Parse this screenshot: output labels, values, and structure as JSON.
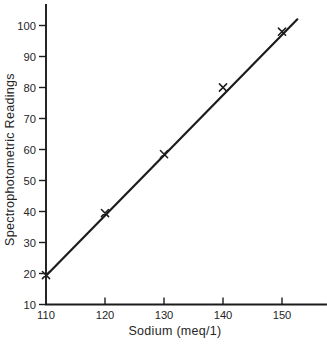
{
  "figure": {
    "background": "#ffffff",
    "ink": "#1c1c1c",
    "label_color": "#262626"
  },
  "chart_data": {
    "type": "scatter",
    "title": "",
    "xlabel": "Sodium (meq/1)",
    "ylabel": "Spectrophotometric Readings",
    "x_ticks": [
      110,
      120,
      130,
      140,
      150
    ],
    "y_ticks": [
      10,
      20,
      30,
      40,
      50,
      60,
      70,
      80,
      90,
      100
    ],
    "xlim": [
      110,
      157.5
    ],
    "ylim": [
      10,
      106.5
    ],
    "points": [
      {
        "x": 110,
        "y": 19.5
      },
      {
        "x": 120,
        "y": 39.5
      },
      {
        "x": 130,
        "y": 58.5
      },
      {
        "x": 140,
        "y": 80
      },
      {
        "x": 150,
        "y": 98
      }
    ],
    "fit_line": {
      "x1": 110,
      "y1": 19.3,
      "x2": 152.6,
      "y2": 102
    },
    "marker": "x",
    "grid": false,
    "legend": "none"
  }
}
